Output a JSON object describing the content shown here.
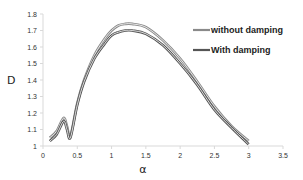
{
  "chart_data": {
    "type": "line",
    "title": "",
    "xlabel": "α",
    "ylabel": "D",
    "xlim": [
      0,
      3.5
    ],
    "ylim": [
      1,
      1.8
    ],
    "xticks": [
      "0",
      "0.5",
      "1",
      "1.5",
      "2",
      "2.5",
      "3",
      "3.5"
    ],
    "yticks": [
      "1",
      "1.1",
      "1.2",
      "1.3",
      "1.4",
      "1.5",
      "1.6",
      "1.7",
      "1.8"
    ],
    "grid": false,
    "legend_position": "upper right",
    "x": [
      0.1,
      0.2,
      0.3,
      0.35,
      0.4,
      0.5,
      0.6,
      0.75,
      0.9,
      1.0,
      1.1,
      1.2,
      1.3,
      1.5,
      1.75,
      2.0,
      2.25,
      2.5,
      2.75,
      3.0
    ],
    "series": [
      {
        "name": "without damping",
        "color": "#8a8a8a",
        "values": [
          1.05,
          1.09,
          1.17,
          1.12,
          1.06,
          1.26,
          1.4,
          1.55,
          1.65,
          1.7,
          1.73,
          1.74,
          1.74,
          1.72,
          1.64,
          1.53,
          1.39,
          1.24,
          1.12,
          1.03
        ]
      },
      {
        "name": "With damping",
        "color": "#555555",
        "values": [
          1.03,
          1.07,
          1.15,
          1.1,
          1.05,
          1.25,
          1.39,
          1.53,
          1.62,
          1.67,
          1.69,
          1.7,
          1.7,
          1.68,
          1.61,
          1.5,
          1.37,
          1.22,
          1.11,
          1.01
        ]
      }
    ]
  }
}
